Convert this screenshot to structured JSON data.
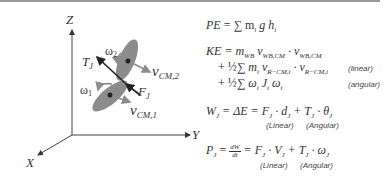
{
  "diagram": {
    "axes": {
      "z": "Z",
      "y": "Y",
      "x": "X"
    },
    "labels": {
      "torque": {
        "base": "T",
        "sub": "J"
      },
      "force": {
        "base": "F",
        "sub": "J"
      },
      "omega2": {
        "base": "ω",
        "sub": "2"
      },
      "omega1": {
        "base": "ω",
        "sub": "1"
      },
      "vcm2": {
        "base": "v",
        "sub": "CM,2"
      },
      "vcm1": {
        "base": "v",
        "sub": "CM,1"
      }
    },
    "colors": {
      "segment": "#8c8c8c",
      "arrow_gray": "#8c8c8c",
      "arrow_dark": "#222222",
      "axis": "#444444"
    }
  },
  "equations": {
    "pe": {
      "lhs": "PE",
      "rhs": "= ∑ m",
      "i1": "i",
      "g": " g h",
      "i2": "i"
    },
    "ke": {
      "line1": {
        "lhs": "KE = m",
        "s1": "WB",
        "v1": " v",
        "s2": "WB,CM",
        "dot": " · v",
        "s3": "WB,CM"
      },
      "line2": {
        "pre": "+ ",
        "half": "½",
        "sum": "∑ m",
        "s1": "i",
        "v1": " v",
        "s2": "R−CM,i",
        "dot": " · v",
        "s3": "R−CM,i",
        "note": "(linear)"
      },
      "line3": {
        "pre": "+ ",
        "half": "½",
        "sum": "∑ ω",
        "s1": "i",
        "j": " J",
        "s2": "i",
        "w": " ω",
        "s3": "i",
        "note": "(angular)"
      }
    },
    "work": {
      "lhs": "W",
      "s1": "J",
      "mid": " = ΔE = F",
      "s2": "J",
      "d": " · d",
      "s3": "J",
      "plus": " + T",
      "s4": "J",
      "th": " · θ",
      "s5": "J",
      "note_linear": "(Linear)",
      "note_angular": "(Angular)"
    },
    "power": {
      "lhs": "P",
      "s1": "J",
      "eq": " = ",
      "num": "dW",
      "den": "dt",
      "eq2": " = F",
      "s2": "J",
      "v": " · V",
      "s3": "J",
      "plus": " + T",
      "s4": "J",
      "w": " · ω",
      "s5": "J",
      "note_linear": "(Linear)",
      "note_angular": "(Angular)"
    }
  }
}
